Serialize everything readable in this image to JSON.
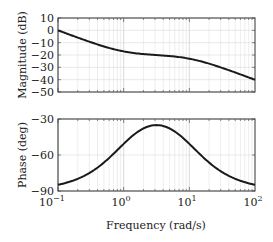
{
  "chart_data": [
    {
      "type": "line",
      "title": "",
      "xlabel": "",
      "ylabel": "Magnitude (dB)",
      "xscale": "log",
      "xlim": [
        0.1,
        100
      ],
      "ylim": [
        -50,
        10
      ],
      "yticks": [
        10,
        0,
        -10,
        -20,
        -30,
        -40,
        -50
      ],
      "grid": true,
      "series": [
        {
          "name": "magnitude",
          "x": [
            0.1,
            0.2,
            0.5,
            1,
            2,
            3.16,
            5,
            10,
            20,
            50,
            100
          ],
          "y": [
            0.0,
            -5.0,
            -11.1,
            -17.0,
            -19.4,
            -20.0,
            -20.6,
            -23.0,
            -28.8,
            -37.0,
            -40.0
          ]
        }
      ]
    },
    {
      "type": "line",
      "title": "",
      "xlabel": "Frequency (rad/s)",
      "ylabel": "Phase (deg)",
      "xscale": "log",
      "xlim": [
        0.1,
        100
      ],
      "ylim": [
        -90,
        -30
      ],
      "yticks": [
        -30,
        -60,
        -90
      ],
      "xticks": [
        "10^-1",
        "10^0",
        "10^1",
        "10^2"
      ],
      "grid": true,
      "series": [
        {
          "name": "phase",
          "x": [
            0.1,
            0.2,
            0.5,
            1,
            2,
            3.16,
            5,
            10,
            20,
            50,
            100
          ],
          "y": [
            -84.9,
            -79.8,
            -66.3,
            -50.7,
            -38.7,
            -35.1,
            -37.6,
            -50.7,
            -66.3,
            -81.0,
            -84.9
          ]
        }
      ]
    }
  ],
  "labels": {
    "mag_ylabel": "Magnitude (dB)",
    "phase_ylabel": "Phase (deg)",
    "xlabel": "Frequency (rad/s)",
    "mag_yticks": [
      "10",
      "0",
      "−10",
      "−20",
      "−30",
      "−40",
      "−50"
    ],
    "phase_yticks": [
      "−30",
      "−60",
      "−90"
    ],
    "xticks": [
      "10",
      "10",
      "10",
      "10"
    ],
    "xtick_exps": [
      "−1",
      "0",
      "1",
      "2"
    ]
  }
}
